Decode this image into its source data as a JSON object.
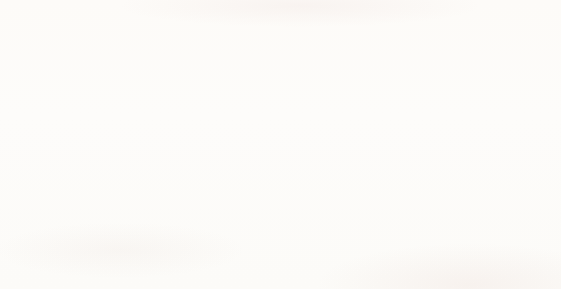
{
  "chart_data": {
    "type": "bar",
    "title": "",
    "subtitle": "",
    "xlabel": "",
    "ylabel": "",
    "orientation": "horizontal",
    "layout": "centered-funnel",
    "grid": false,
    "legend": null,
    "xlim": [
      0,
      100
    ],
    "bar_color": "#b5442f",
    "value_label_color": "#f6ece4",
    "category_label_color": "#26262a",
    "background_color": "#fdfcfa",
    "categories": [
      "Bangladesh",
      "Haiti",
      "Cambodia",
      "Nepal",
      "Bhutan",
      "Lesotho",
      "Central African Rep.",
      "Liberia",
      "Myanmar",
      "Niger",
      "Tuvalu",
      "Comoras"
    ],
    "values": [
      95,
      84,
      77,
      68,
      59,
      57,
      50,
      46,
      40,
      33,
      32,
      31
    ],
    "rows": [
      {
        "label": "Bangladesh",
        "value": 95,
        "value_text": "95"
      },
      {
        "label": "Haiti",
        "value": 84,
        "value_text": "84"
      },
      {
        "label": "Cambodia",
        "value": 77,
        "value_text": "77"
      },
      {
        "label": "Nepal",
        "value": 68,
        "value_text": "68"
      },
      {
        "label": "Bhutan",
        "value": 59,
        "value_text": "59"
      },
      {
        "label": "Lesotho",
        "value": 57,
        "value_text": "57"
      },
      {
        "label": "Central African Rep.",
        "value": 50,
        "value_text": "50"
      },
      {
        "label": "Liberia",
        "value": 46,
        "value_text": "46"
      },
      {
        "label": "Myanmar",
        "value": 40,
        "value_text": "40"
      },
      {
        "label": "Niger",
        "value": 33,
        "value_text": "33"
      },
      {
        "label": "Tuvalu",
        "value": 32,
        "value_text": "32"
      },
      {
        "label": "Comoras",
        "value": 31,
        "value_text": "31"
      }
    ]
  }
}
